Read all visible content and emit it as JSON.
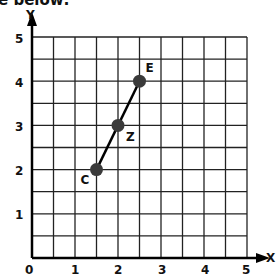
{
  "header": {
    "instruction_fragment": "e below:"
  },
  "graph": {
    "x_axis_label": "X",
    "y_axis_label": "Y",
    "x_ticks": [
      "0",
      "1",
      "2",
      "3",
      "4",
      "5"
    ],
    "y_ticks": [
      "1",
      "2",
      "3",
      "4",
      "5"
    ],
    "x_range": [
      0,
      5
    ],
    "y_range": [
      0,
      5
    ],
    "grid_step": 0.5,
    "points": [
      {
        "label": "C",
        "x": 1.5,
        "y": 2
      },
      {
        "label": "Z",
        "x": 2,
        "y": 3
      },
      {
        "label": "E",
        "x": 2.5,
        "y": 4
      }
    ],
    "segment": {
      "from": "C",
      "to": "E"
    },
    "point_color": "#3a3a3a",
    "line_color": "#000000",
    "grid_color": "#222222"
  }
}
